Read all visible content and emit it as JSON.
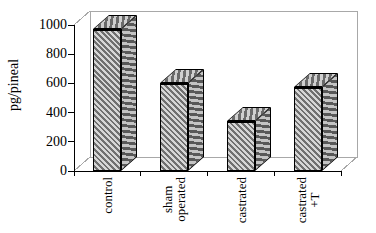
{
  "chart_data": {
    "type": "bar",
    "projection": "3d",
    "title": "",
    "xlabel": "",
    "ylabel": "pg/pineal",
    "categories": [
      "control",
      "sham operated",
      "castrated",
      "castrated +T"
    ],
    "category_label_lines": [
      [
        "control"
      ],
      [
        "sham",
        "operated"
      ],
      [
        "castrated"
      ],
      [
        "castrated",
        "+T"
      ]
    ],
    "values": [
      970,
      600,
      340,
      575
    ],
    "ylim": [
      0,
      1000
    ],
    "yticks": [
      0,
      200,
      400,
      600,
      800,
      1000
    ],
    "grid": false,
    "legend_position": "none",
    "bar_fill_style": "diagonal-hatch",
    "colors": {
      "background": "#ffffff",
      "outline": "#000000",
      "frame": "#a8a8a8",
      "axis": "#000000",
      "text": "#000000",
      "bar_hatch_light": "#d6d6d6",
      "bar_hatch_dark": "#707070"
    }
  }
}
